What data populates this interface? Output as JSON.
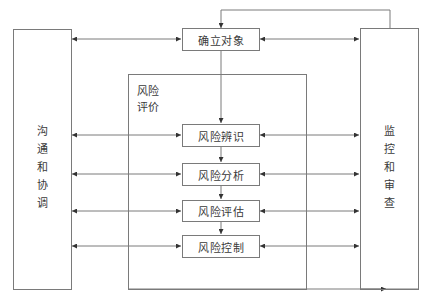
{
  "diagram": {
    "type": "flowchart",
    "left_panel": {
      "label_chars": [
        "沟",
        "通",
        "和",
        "协",
        "调"
      ],
      "label": "沟通和协调"
    },
    "right_panel": {
      "label_chars": [
        "监",
        "控",
        "和",
        "审",
        "查"
      ],
      "label": "监控和审查"
    },
    "top_box": {
      "label": "确立对象"
    },
    "assessment_container": {
      "label_line1": "风险",
      "label_line2": "评价",
      "label": "风险评价"
    },
    "steps": [
      {
        "label": "风险辨识"
      },
      {
        "label": "风险分析"
      },
      {
        "label": "风险评估"
      },
      {
        "label": "风险控制"
      }
    ],
    "connections": [
      {
        "from": "沟通和协调",
        "to": "确立对象",
        "type": "bidirectional"
      },
      {
        "from": "确立对象",
        "to": "监控和审查",
        "type": "bidirectional"
      },
      {
        "from": "沟通和协调",
        "to": "风险辨识",
        "type": "bidirectional"
      },
      {
        "from": "风险辨识",
        "to": "监控和审查",
        "type": "bidirectional"
      },
      {
        "from": "沟通和协调",
        "to": "风险分析",
        "type": "bidirectional"
      },
      {
        "from": "风险分析",
        "to": "监控和审查",
        "type": "bidirectional"
      },
      {
        "from": "沟通和协调",
        "to": "风险评估",
        "type": "bidirectional"
      },
      {
        "from": "风险评估",
        "to": "监控和审查",
        "type": "bidirectional"
      },
      {
        "from": "沟通和协调",
        "to": "风险控制",
        "type": "bidirectional"
      },
      {
        "from": "风险控制",
        "to": "监控和审查",
        "type": "bidirectional"
      },
      {
        "from": "确立对象",
        "to": "风险辨识",
        "type": "directed"
      },
      {
        "from": "风险辨识",
        "to": "风险分析",
        "type": "directed"
      },
      {
        "from": "风险分析",
        "to": "风险评估",
        "type": "directed"
      },
      {
        "from": "风险评估",
        "to": "风险控制",
        "type": "directed"
      },
      {
        "from": "风险评价",
        "to": "监控和审查",
        "type": "directed"
      },
      {
        "from": "监控和审查",
        "to": "确立对象",
        "type": "directed",
        "note": "feedback loop over top"
      }
    ],
    "colors": {
      "line": "#7a7a7a",
      "arrow": "#333333",
      "text": "#3a3a3a",
      "background": "#ffffff"
    }
  }
}
